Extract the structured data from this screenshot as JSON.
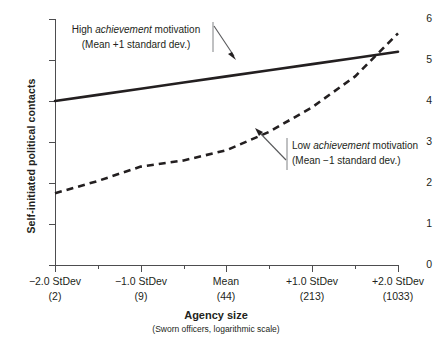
{
  "chart_data": {
    "type": "line",
    "title": "",
    "xlabel": "Agency size",
    "xsublabel": "(Sworn officers, logarithmic scale)",
    "ylabel": "Self-initiated political contacts",
    "ylim": [
      0,
      6
    ],
    "yticks": [
      0,
      1,
      2,
      3,
      4,
      5,
      6
    ],
    "ytick_labels": [
      "0",
      "1",
      "2",
      "3",
      "4",
      "5",
      "6"
    ],
    "xlim": [
      -2.0,
      2.0
    ],
    "xticks": [
      -2.0,
      -1.0,
      0.0,
      1.0,
      2.0
    ],
    "xtick_labels": [
      "−2.0 StDev",
      "−1.0 StDev",
      "Mean",
      "+1.0 StDev",
      "+2.0 StDev"
    ],
    "xtick_sublabels": [
      "(2)",
      "(9)",
      "(44)",
      "(213)",
      "(1033)"
    ],
    "grid": false,
    "legend": "annotations",
    "x": [
      -2.0,
      -1.5,
      -1.0,
      -0.5,
      0.0,
      0.5,
      1.0,
      1.5,
      2.0
    ],
    "series": [
      {
        "name": "High achievement motivation (Mean +1 standard dev.)",
        "style": "solid",
        "color": "#231f20",
        "values": [
          4.0,
          4.15,
          4.3,
          4.45,
          4.6,
          4.75,
          4.9,
          5.05,
          5.2
        ]
      },
      {
        "name": "Low achievement motivation (Mean −1 standard dev.)",
        "style": "dashed",
        "color": "#231f20",
        "values": [
          1.75,
          2.05,
          2.4,
          2.55,
          2.8,
          3.25,
          3.85,
          4.6,
          5.65
        ]
      }
    ],
    "annotations": [
      {
        "id": "high",
        "line1_pre": "High ",
        "line1_em": "achievement",
        "line1_post": " motivation",
        "line2": "(Mean +1 standard dev.)",
        "arrow": "down-right"
      },
      {
        "id": "low",
        "line1_pre": "Low ",
        "line1_em": "achievement",
        "line1_post": " motivation",
        "line2": "(Mean −1 standard dev.)",
        "arrow": "up-left"
      }
    ]
  }
}
